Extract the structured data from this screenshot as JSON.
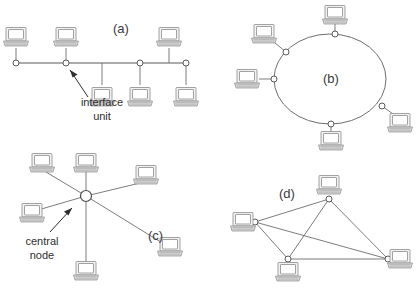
{
  "figure": {
    "background_color": "#ffffff",
    "line_color": "#6e6e6e",
    "icon_fill": "#f2f2f2",
    "icon_stroke": "#8a8a8a",
    "text_color": "#2e2e2e"
  },
  "panels": {
    "a": {
      "label": "(a)",
      "topology": "bus",
      "label_x": 113,
      "label_y": 33
    },
    "b": {
      "label": "(b)",
      "topology": "ring",
      "label_x": 323,
      "label_y": 83
    },
    "c": {
      "label": "(c)",
      "topology": "star",
      "label_x": 148,
      "label_y": 240
    },
    "d": {
      "label": "(d)",
      "topology": "mesh",
      "label_x": 279,
      "label_y": 198
    }
  },
  "annotations": {
    "interface_unit": {
      "line1": "interface",
      "line2": "unit",
      "x": 102,
      "y1": 106,
      "y2": 120
    },
    "central_node": {
      "line1": "central",
      "line2": "node",
      "x": 42,
      "y1": 245,
      "y2": 259
    }
  },
  "bus": {
    "line": {
      "x1": 16,
      "y1": 63,
      "x2": 186,
      "y2": 63
    },
    "taps": [
      {
        "x": 16,
        "y": 63
      },
      {
        "x": 66,
        "y": 63
      },
      {
        "x": 140,
        "y": 63
      },
      {
        "x": 186,
        "y": 63
      }
    ],
    "stubs": [
      {
        "x1": 16,
        "y1": 63,
        "x2": 16,
        "y2": 48
      },
      {
        "x1": 66,
        "y1": 63,
        "x2": 66,
        "y2": 48
      },
      {
        "x1": 102,
        "y1": 63,
        "x2": 102,
        "y2": 85
      },
      {
        "x1": 140,
        "y1": 63,
        "x2": 140,
        "y2": 85
      },
      {
        "x1": 169,
        "y1": 63,
        "x2": 169,
        "y2": 48
      },
      {
        "x1": 186,
        "y1": 63,
        "x2": 186,
        "y2": 85
      }
    ],
    "computers": [
      {
        "x": 16,
        "y": 37
      },
      {
        "x": 66,
        "y": 37
      },
      {
        "x": 169,
        "y": 37
      },
      {
        "x": 102,
        "y": 97
      },
      {
        "x": 140,
        "y": 97
      },
      {
        "x": 186,
        "y": 97
      }
    ]
  },
  "ring": {
    "ellipse": {
      "cx": 330,
      "cy": 79,
      "rx": 56,
      "ry": 45
    },
    "taps": [
      {
        "x": 335,
        "y": 34
      },
      {
        "x": 286,
        "y": 52
      },
      {
        "x": 274,
        "y": 79
      },
      {
        "x": 382,
        "y": 106
      },
      {
        "x": 331,
        "y": 124
      }
    ],
    "stubs": [
      {
        "x1": 335,
        "y1": 34,
        "x2": 335,
        "y2": 24
      },
      {
        "x1": 286,
        "y1": 52,
        "x2": 275,
        "y2": 43
      },
      {
        "x1": 274,
        "y1": 79,
        "x2": 259,
        "y2": 79
      },
      {
        "x1": 382,
        "y1": 106,
        "x2": 393,
        "y2": 114
      },
      {
        "x1": 331,
        "y1": 124,
        "x2": 331,
        "y2": 133
      }
    ],
    "computers": [
      {
        "x": 335,
        "y": 15
      },
      {
        "x": 264,
        "y": 34
      },
      {
        "x": 247,
        "y": 79
      },
      {
        "x": 400,
        "y": 123
      },
      {
        "x": 331,
        "y": 141
      }
    ]
  },
  "star": {
    "hub": {
      "x": 86,
      "y": 196,
      "r": 5.5
    },
    "spokes": [
      {
        "x1": 86,
        "y1": 196,
        "x2": 46,
        "y2": 172
      },
      {
        "x1": 86,
        "y1": 196,
        "x2": 86,
        "y2": 172
      },
      {
        "x1": 86,
        "y1": 196,
        "x2": 140,
        "y2": 183
      },
      {
        "x1": 86,
        "y1": 196,
        "x2": 38,
        "y2": 210
      },
      {
        "x1": 86,
        "y1": 196,
        "x2": 86,
        "y2": 262
      },
      {
        "x1": 86,
        "y1": 196,
        "x2": 164,
        "y2": 244
      }
    ],
    "computers": [
      {
        "x": 42,
        "y": 163
      },
      {
        "x": 86,
        "y": 163
      },
      {
        "x": 146,
        "y": 175
      },
      {
        "x": 32,
        "y": 213
      },
      {
        "x": 86,
        "y": 271
      },
      {
        "x": 170,
        "y": 247
      }
    ]
  },
  "mesh": {
    "nodes": [
      {
        "id": "top",
        "x": 329,
        "y": 199
      },
      {
        "id": "left",
        "x": 255,
        "y": 222
      },
      {
        "id": "bottom",
        "x": 288,
        "y": 259
      },
      {
        "id": "right",
        "x": 388,
        "y": 259
      }
    ],
    "links": [
      {
        "from": "left",
        "to": "top"
      },
      {
        "from": "left",
        "to": "bottom"
      },
      {
        "from": "left",
        "to": "right"
      },
      {
        "from": "top",
        "to": "bottom"
      },
      {
        "from": "top",
        "to": "right"
      },
      {
        "from": "bottom",
        "to": "right"
      }
    ],
    "computers": [
      {
        "x": 329,
        "y": 185,
        "anchor": "above"
      },
      {
        "x": 243,
        "y": 222,
        "anchor": "left"
      },
      {
        "x": 288,
        "y": 272,
        "anchor": "below"
      },
      {
        "x": 400,
        "y": 259,
        "anchor": "right"
      }
    ]
  }
}
